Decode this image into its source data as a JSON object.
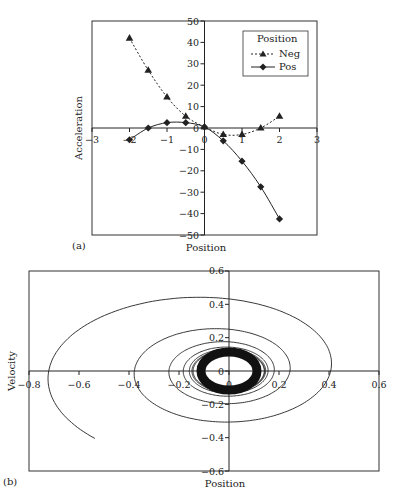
{
  "chart_data": [
    {
      "panel": "(a)",
      "type": "line",
      "title": "",
      "xlabel": "Position",
      "ylabel": "Acceleration",
      "xlim": [
        -3,
        3
      ],
      "ylim": [
        -50,
        50
      ],
      "x_ticks": [
        -3,
        -2,
        -1,
        0,
        1,
        2,
        3
      ],
      "y_ticks": [
        -50,
        -40,
        -30,
        -20,
        -10,
        0,
        10,
        20,
        30,
        40,
        50
      ],
      "grid": false,
      "legend": {
        "title": "Position",
        "position": "upper right",
        "entries": [
          "Neg",
          "Pos"
        ]
      },
      "x": [
        -2,
        -1.5,
        -1,
        -0.5,
        0,
        0.5,
        1,
        1.5,
        2
      ],
      "series": [
        {
          "name": "Neg",
          "marker": "triangle",
          "line": "dashed",
          "values": [
            42,
            27,
            14.5,
            5.5,
            0.5,
            -3,
            -3,
            0,
            5.5
          ]
        },
        {
          "name": "Pos",
          "marker": "diamond",
          "line": "solid",
          "values": [
            -5.5,
            0,
            2.5,
            2.5,
            0.5,
            -6,
            -15.5,
            -27.5,
            -42.5
          ]
        }
      ]
    },
    {
      "panel": "(b)",
      "type": "line",
      "title": "",
      "xlabel": "Position",
      "ylabel": "Velocity",
      "xlim": [
        -0.8,
        0.6
      ],
      "ylim": [
        -0.6,
        0.6
      ],
      "x_ticks": [
        -0.8,
        -0.6,
        -0.4,
        -0.2,
        0,
        0.2,
        0.4,
        0.6
      ],
      "y_ticks": [
        -0.6,
        -0.4,
        -0.2,
        0,
        0.2,
        0.4,
        0.6
      ],
      "grid": false,
      "description": "Phase-plane spiral decaying toward a limit cycle around the origin",
      "series": [
        {
          "name": "trajectory",
          "start": [
            -0.5,
            -0.42
          ],
          "x_crossings": [
            -0.61,
            0.43,
            -0.36,
            0.31,
            -0.28,
            0.24,
            -0.22,
            0.2,
            -0.19,
            0.18
          ],
          "limit_cycle": {
            "x_radius": 0.13,
            "y_radius": 0.13
          }
        }
      ]
    }
  ],
  "panel_a": {
    "label": "(a)",
    "xlabel": "Position",
    "ylabel": "Acceleration",
    "legend_title": "Position",
    "legend_neg": "Neg",
    "legend_pos": "Pos",
    "x_tick_labels": [
      "−3",
      "−2",
      "−1",
      "0",
      "1",
      "2",
      "3"
    ],
    "y_tick_labels": [
      "50",
      "40",
      "30",
      "20",
      "10",
      "0",
      "−10",
      "−20",
      "−30",
      "−40",
      "−50"
    ]
  },
  "panel_b": {
    "label": "(b)",
    "xlabel": "Position",
    "ylabel": "Velocity",
    "x_tick_labels": [
      "−0.8",
      "−0.6",
      "−0.4",
      "−0.2",
      "0",
      "0.2",
      "0.4",
      "0.6"
    ],
    "y_tick_labels": [
      "0.6",
      "0.4",
      "0.2",
      "0",
      "−0.2",
      "−0.4",
      "−0.6"
    ]
  },
  "colors": {
    "ink": "#222222",
    "background": "#ffffff"
  }
}
